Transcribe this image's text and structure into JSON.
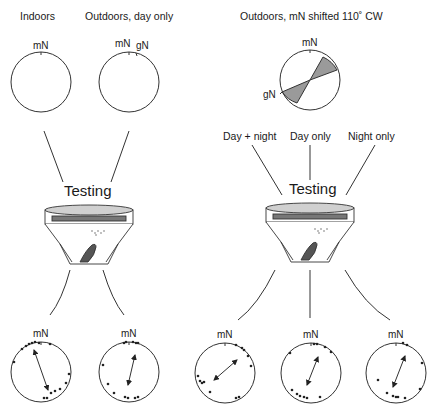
{
  "panels": {
    "left": {
      "conditions": [
        {
          "label": "Indoors",
          "north_label": "mN"
        },
        {
          "label": "Outdoors, day only",
          "north_labels": [
            "mN",
            "gN"
          ]
        }
      ],
      "testing_label": "Testing",
      "results": [
        {
          "north_label": "mN",
          "mean_axis_deg": 160,
          "distribution": "bimodal axial NNW-SSE"
        },
        {
          "north_label": "mN",
          "mean_axis_deg": 15,
          "distribution": "bimodal axial N-S"
        }
      ]
    },
    "right": {
      "condition": {
        "label": "Outdoors, mN shifted 110˚ CW",
        "north_labels": [
          "mN",
          "gN"
        ]
      },
      "subconditions": [
        "Day + night",
        "Day only",
        "Night only"
      ],
      "testing_label": "Testing",
      "results": [
        {
          "north_label": "mN",
          "mean_axis_deg": 55,
          "distribution": "bimodal axial NE-SW"
        },
        {
          "north_label": "mN",
          "mean_axis_deg": 20,
          "distribution": "bimodal axial NNE-SSW"
        },
        {
          "north_label": "mN",
          "mean_axis_deg": 22,
          "distribution": "bimodal axial NNE-SSW"
        }
      ]
    }
  },
  "colors": {
    "line": "#333333",
    "sector_fill": "#9a9a9a",
    "lid_fill": "#d0d0d0"
  }
}
